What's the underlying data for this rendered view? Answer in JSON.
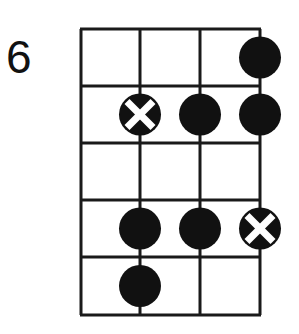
{
  "diagram": {
    "type": "bass-fretboard-scale-diagram",
    "start_fret_label": "6",
    "strings": 4,
    "frets": 5,
    "colors": {
      "line": "#1a1a1a",
      "dot": "#111111",
      "x_mark": "#ffffff",
      "background": "#ffffff"
    },
    "markers": [
      {
        "fret": 1,
        "string": 4,
        "kind": "dot"
      },
      {
        "fret": 2,
        "string": 2,
        "kind": "root-x"
      },
      {
        "fret": 2,
        "string": 3,
        "kind": "dot"
      },
      {
        "fret": 2,
        "string": 4,
        "kind": "dot"
      },
      {
        "fret": 4,
        "string": 2,
        "kind": "dot"
      },
      {
        "fret": 4,
        "string": 3,
        "kind": "dot"
      },
      {
        "fret": 4,
        "string": 4,
        "kind": "root-x"
      },
      {
        "fret": 5,
        "string": 2,
        "kind": "dot"
      }
    ]
  }
}
